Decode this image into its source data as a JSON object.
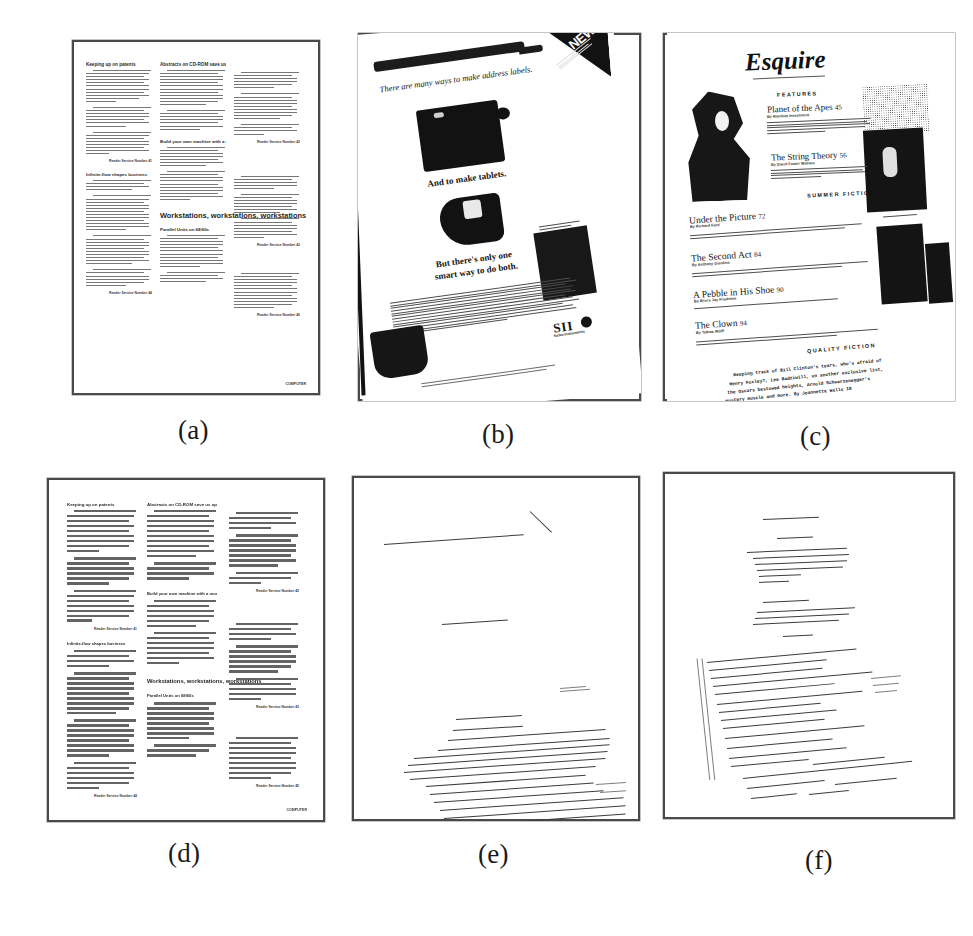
{
  "figure": {
    "kind": "document-image-analysis-figure",
    "panel_count": 6,
    "captions": [
      "(a)",
      "(b)",
      "(c)",
      "(d)",
      "(e)",
      "(f)"
    ]
  },
  "panels": [
    {
      "id": "a",
      "caption": "(a)",
      "type": "original-document",
      "description": "Three-column technical newsletter page, upright"
    },
    {
      "id": "b",
      "caption": "(b)",
      "type": "original-document",
      "description": "Skewed magazine advertisement page with photographs"
    },
    {
      "id": "c",
      "caption": "(c)",
      "type": "original-document",
      "description": "Skewed Esquire magazine table-of-contents page"
    },
    {
      "id": "d",
      "caption": "(d)",
      "type": "segmentation-result",
      "description": "Smeared text-line blocks extracted from panel (a)"
    },
    {
      "id": "e",
      "caption": "(e)",
      "type": "segmentation-result",
      "description": "Extracted skewed baselines from panel (b)"
    },
    {
      "id": "f",
      "caption": "(f)",
      "type": "segmentation-result",
      "description": "Extracted skewed baselines from panel (c)"
    }
  ],
  "doc_a": {
    "headings": {
      "h1": "Keeping up on patents",
      "h2": "Abstracts on CD-ROM save us option",
      "h3": "Infinite-flow shapes business",
      "h4": "Build your own machine with a mouse",
      "h5": "Workstations, workstations, workstations",
      "h6": "Parallel Units on 68/60s"
    },
    "reader_service": "Reader Service Number 41",
    "reader_service_2": "Reader Service Number 42",
    "reader_service_3": "Reader Service Number 43",
    "reader_service_4": "Reader Service Number 44",
    "reader_service_5": "Reader Service Number 45",
    "reader_service_6": "Reader Service Number 46",
    "page_footer": "COMPUTER"
  },
  "doc_b": {
    "corner_banner": "NEW!",
    "headline_script": "There are many ways to make address labels.",
    "caption_mid": "And to make tablets.",
    "caption_low_1": "But there's only one",
    "caption_low_2": "smart way to do both.",
    "brand": "SII",
    "brand_sub": "Seiko Instruments"
  },
  "doc_c": {
    "masthead": "Esquire",
    "section_features": "FEATURES",
    "section_summer": "SUMMER FICTION",
    "section_quality": "QUALITY FICTION",
    "features": [
      {
        "title": "Planet of the Apes",
        "page": "45",
        "byline": "By Random Investment"
      },
      {
        "title": "The String Theory",
        "page": "56",
        "byline": "By David Foster Wallace"
      },
      {
        "title": "Under the Picture",
        "page": "72",
        "byline": "By Richard Ford"
      },
      {
        "title": "The Second Act",
        "page": "84",
        "byline": "By Anthony Giardina"
      },
      {
        "title": "A Pebble in His Shoe",
        "page": "90",
        "byline": "By Bruce Jay Friedman"
      },
      {
        "title": "The Clown",
        "page": "94",
        "byline": "By Tobias Wolff"
      }
    ],
    "footer_mono_lines": [
      "Keeping track of Bill Clinton's tears, who's afraid of",
      "Henry Foxley?, Lee Radziwill, on another exclusive list,",
      "the Oscars  bestowed heights, Arnold Schwarzenegger's",
      "mystery muscle  and more. By Jeannette Walls 18"
    ]
  },
  "colors": {
    "background": "#ffffff",
    "ink": "#1a1a1a",
    "frame": "#4a4a4a",
    "line": "#5a5a5a",
    "smear": "#575757"
  }
}
